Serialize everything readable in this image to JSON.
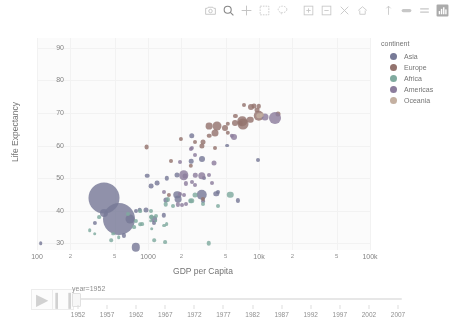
{
  "modebar": {
    "buttons": [
      {
        "name": "camera-icon",
        "title": "Download plot as a png"
      },
      {
        "name": "zoom-icon",
        "title": "Zoom"
      },
      {
        "name": "pan-icon",
        "title": "Pan"
      },
      {
        "name": "zoom-box-select-icon",
        "title": "Box Select"
      },
      {
        "name": "lasso-select-icon",
        "title": "Lasso Select"
      },
      {
        "name": "zoom-in-icon",
        "title": "Zoom in"
      },
      {
        "name": "zoom-out-icon",
        "title": "Zoom out"
      },
      {
        "name": "autoscale-icon",
        "title": "Autoscale"
      },
      {
        "name": "reset-axes-icon",
        "title": "Reset axes"
      },
      {
        "name": "spike-lines-icon",
        "title": "Toggle Spike Lines"
      },
      {
        "name": "hover-compare-icon",
        "title": "Show closest data on hover"
      },
      {
        "name": "hover-closest-icon",
        "title": "Compare data on hover"
      },
      {
        "name": "plotly-logo-icon",
        "title": "Produced with Plotly"
      }
    ]
  },
  "chart_data": {
    "type": "scatter",
    "title": "",
    "xlabel": "GDP per Capita",
    "ylabel": "Life Expectancy",
    "xscale": "log",
    "xlim": [
      100,
      100000
    ],
    "ylim": [
      28,
      93
    ],
    "grid": false,
    "legend_position": "right",
    "legend_title": "continent",
    "size_variable": "population",
    "frame_variable": "year",
    "frame_value": "1952",
    "ytick_labels": [
      "30",
      "40",
      "50",
      "60",
      "70",
      "80",
      "90"
    ],
    "ytick_values": [
      30,
      40,
      50,
      60,
      70,
      80,
      90
    ],
    "xtick_labels": [
      "100",
      "2",
      "5",
      "1000",
      "2",
      "5",
      "10k",
      "2",
      "5",
      "100k"
    ],
    "xtick_values": [
      100,
      200,
      500,
      1000,
      2000,
      5000,
      10000,
      20000,
      50000,
      100000
    ],
    "series": [
      {
        "name": "Asia",
        "color": "#636efa",
        "points": [
          {
            "x": 779,
            "y": 28.8,
            "size": 8.4
          },
          {
            "x": 1828,
            "y": 50.9,
            "size": 5.0
          },
          {
            "x": 684,
            "y": 37.5,
            "size": 9.0
          },
          {
            "x": 400,
            "y": 39.4,
            "size": 8.0
          },
          {
            "x": 3216,
            "y": 50.0,
            "size": 4.0
          },
          {
            "x": 400,
            "y": 44.0,
            "size": 31.0
          },
          {
            "x": 546,
            "y": 37.4,
            "size": 32.0
          },
          {
            "x": 3035,
            "y": 44.9,
            "size": 10.5
          },
          {
            "x": 4130,
            "y": 45.3,
            "size": 5.5
          },
          {
            "x": 1447,
            "y": 43.4,
            "size": 5.2
          },
          {
            "x": 3054,
            "y": 55.9,
            "size": 6.0
          },
          {
            "x": 1875,
            "y": 43.6,
            "size": 6.8
          },
          {
            "x": 2469,
            "y": 63.0,
            "size": 5.5
          },
          {
            "x": 1074,
            "y": 47.5,
            "size": 4.8
          },
          {
            "x": 840,
            "y": 40.4,
            "size": 4.6
          },
          {
            "x": 1469,
            "y": 50.0,
            "size": 4.4
          },
          {
            "x": 331,
            "y": 36.3,
            "size": 4.2
          },
          {
            "x": 1135,
            "y": 37.5,
            "size": 5.8
          },
          {
            "x": 4293,
            "y": 45.9,
            "size": 4.0
          },
          {
            "x": 6459,
            "y": 43.2,
            "size": 4.2
          },
          {
            "x": 1831,
            "y": 45.0,
            "size": 7.5
          },
          {
            "x": 968,
            "y": 40.4,
            "size": 5.0
          },
          {
            "x": 982,
            "y": 50.8,
            "size": 4.6
          },
          {
            "x": 1206,
            "y": 48.5,
            "size": 4.8
          },
          {
            "x": 9867,
            "y": 55.6,
            "size": 4.0
          },
          {
            "x": 108,
            "y": 30.0,
            "size": 3.6
          },
          {
            "x": 1133,
            "y": 36.3,
            "size": 4.0
          },
          {
            "x": 1389,
            "y": 38.6,
            "size": 4.4
          },
          {
            "x": 2441,
            "y": 55.2,
            "size": 4.6
          },
          {
            "x": 605,
            "y": 32.5,
            "size": 4.2
          },
          {
            "x": 3113,
            "y": 42.9,
            "size": 3.8
          },
          {
            "x": 5180,
            "y": 60.0,
            "size": 3.8
          },
          {
            "x": 781,
            "y": 40.0,
            "size": 4.0
          }
        ]
      },
      {
        "name": "Europe",
        "color": "#EF553B",
        "points": [
          {
            "x": 1601,
            "y": 55.2,
            "size": 4.0
          },
          {
            "x": 6137,
            "y": 66.8,
            "size": 6.0
          },
          {
            "x": 8343,
            "y": 68.0,
            "size": 6.5
          },
          {
            "x": 973,
            "y": 59.6,
            "size": 4.8
          },
          {
            "x": 3119,
            "y": 61.2,
            "size": 5.0
          },
          {
            "x": 6876,
            "y": 66.9,
            "size": 4.5
          },
          {
            "x": 9692,
            "y": 70.8,
            "size": 5.0
          },
          {
            "x": 5263,
            "y": 66.6,
            "size": 4.4
          },
          {
            "x": 7029,
            "y": 67.4,
            "size": 9.5
          },
          {
            "x": 7144,
            "y": 66.5,
            "size": 11.0
          },
          {
            "x": 3530,
            "y": 65.9,
            "size": 6.8
          },
          {
            "x": 5263,
            "y": 64.0,
            "size": 4.4
          },
          {
            "x": 7268,
            "y": 72.5,
            "size": 4.0
          },
          {
            "x": 4931,
            "y": 65.5,
            "size": 6.0
          },
          {
            "x": 4215,
            "y": 65.9,
            "size": 9.0
          },
          {
            "x": 9908,
            "y": 72.1,
            "size": 4.4
          },
          {
            "x": 4029,
            "y": 59.2,
            "size": 4.0
          },
          {
            "x": 8942,
            "y": 72.1,
            "size": 5.0
          },
          {
            "x": 4029,
            "y": 64.0,
            "size": 7.0
          },
          {
            "x": 3068,
            "y": 59.8,
            "size": 5.2
          },
          {
            "x": 1969,
            "y": 62.1,
            "size": 4.2
          },
          {
            "x": 2647,
            "y": 61.0,
            "size": 4.0
          },
          {
            "x": 3581,
            "y": 63.0,
            "size": 4.6
          },
          {
            "x": 6137,
            "y": 69.1,
            "size": 4.2
          },
          {
            "x": 8527,
            "y": 71.9,
            "size": 6.0
          },
          {
            "x": 14734,
            "y": 69.6,
            "size": 5.0
          },
          {
            "x": 9979,
            "y": 69.2,
            "size": 10.5
          },
          {
            "x": 3144,
            "y": 43.7,
            "size": 4.0
          },
          {
            "x": 1546,
            "y": 45.0,
            "size": 4.2
          },
          {
            "x": 2428,
            "y": 53.8,
            "size": 4.4
          }
        ]
      },
      {
        "name": "Africa",
        "color": "#00cc96",
        "points": [
          {
            "x": 2449,
            "y": 43.1,
            "size": 5.5
          },
          {
            "x": 3521,
            "y": 30.0,
            "size": 4.5
          },
          {
            "x": 1063,
            "y": 38.2,
            "size": 4.0
          },
          {
            "x": 851,
            "y": 40.0,
            "size": 3.8
          },
          {
            "x": 543,
            "y": 32.0,
            "size": 3.6
          },
          {
            "x": 667,
            "y": 39.0,
            "size": 4.0
          },
          {
            "x": 1172,
            "y": 38.5,
            "size": 4.0
          },
          {
            "x": 1071,
            "y": 40.0,
            "size": 4.0
          },
          {
            "x": 1388,
            "y": 35.5,
            "size": 3.8
          },
          {
            "x": 1178,
            "y": 37.0,
            "size": 3.6
          },
          {
            "x": 1135,
            "y": 31.0,
            "size": 3.6
          },
          {
            "x": 299,
            "y": 34.0,
            "size": 3.6
          },
          {
            "x": 362,
            "y": 38.0,
            "size": 3.8
          },
          {
            "x": 485,
            "y": 33.0,
            "size": 3.6
          },
          {
            "x": 879,
            "y": 36.0,
            "size": 3.8
          },
          {
            "x": 1443,
            "y": 42.0,
            "size": 4.6
          },
          {
            "x": 2463,
            "y": 42.9,
            "size": 4.0
          },
          {
            "x": 1418,
            "y": 30.3,
            "size": 3.8
          },
          {
            "x": 331,
            "y": 33.0,
            "size": 3.6
          },
          {
            "x": 4293,
            "y": 41.4,
            "size": 4.0
          },
          {
            "x": 853,
            "y": 36.0,
            "size": 3.6
          },
          {
            "x": 1688,
            "y": 41.5,
            "size": 4.0
          },
          {
            "x": 779,
            "y": 37.0,
            "size": 4.2
          },
          {
            "x": 1077,
            "y": 38.0,
            "size": 4.8
          },
          {
            "x": 2672,
            "y": 45.0,
            "size": 5.0
          },
          {
            "x": 1077,
            "y": 34.5,
            "size": 3.6
          },
          {
            "x": 468,
            "y": 31.0,
            "size": 3.6
          },
          {
            "x": 752,
            "y": 35.0,
            "size": 3.8
          },
          {
            "x": 1062,
            "y": 37.0,
            "size": 3.6
          },
          {
            "x": 3112,
            "y": 42.0,
            "size": 4.0
          },
          {
            "x": 5486,
            "y": 45.0,
            "size": 6.5
          },
          {
            "x": 1515,
            "y": 43.5,
            "size": 4.2
          },
          {
            "x": 1468,
            "y": 36.0,
            "size": 3.8
          }
        ]
      },
      {
        "name": "Americas",
        "color": "#ab63fa",
        "points": [
          {
            "x": 5911,
            "y": 62.5,
            "size": 6.0
          },
          {
            "x": 2677,
            "y": 50.9,
            "size": 4.4
          },
          {
            "x": 2109,
            "y": 50.9,
            "size": 9.5
          },
          {
            "x": 3939,
            "y": 54.7,
            "size": 5.0
          },
          {
            "x": 2144,
            "y": 50.6,
            "size": 5.0
          },
          {
            "x": 2627,
            "y": 57.2,
            "size": 4.0
          },
          {
            "x": 1397,
            "y": 45.9,
            "size": 4.0
          },
          {
            "x": 2480,
            "y": 59.4,
            "size": 4.2
          },
          {
            "x": 3522,
            "y": 51.0,
            "size": 4.0
          },
          {
            "x": 2194,
            "y": 48.4,
            "size": 4.2
          },
          {
            "x": 2627,
            "y": 48.0,
            "size": 4.0
          },
          {
            "x": 1873,
            "y": 42.0,
            "size": 4.2
          },
          {
            "x": 2194,
            "y": 42.0,
            "size": 4.0
          },
          {
            "x": 2023,
            "y": 41.9,
            "size": 4.0
          },
          {
            "x": 1952,
            "y": 45.3,
            "size": 4.0
          },
          {
            "x": 3048,
            "y": 50.8,
            "size": 7.5
          },
          {
            "x": 2480,
            "y": 49.0,
            "size": 4.0
          },
          {
            "x": 1952,
            "y": 55.1,
            "size": 4.0
          },
          {
            "x": 2428,
            "y": 59.1,
            "size": 4.2
          },
          {
            "x": 13990,
            "y": 68.4,
            "size": 12.0
          },
          {
            "x": 11367,
            "y": 68.8,
            "size": 7.0
          },
          {
            "x": 5716,
            "y": 63.0,
            "size": 4.4
          },
          {
            "x": 3758,
            "y": 48.4,
            "size": 4.0
          },
          {
            "x": 2125,
            "y": 45.0,
            "size": 4.0
          }
        ]
      },
      {
        "name": "Oceania",
        "color": "#FFA15A",
        "points": [
          {
            "x": 10040,
            "y": 69.1,
            "size": 5.5
          },
          {
            "x": 10557,
            "y": 69.4,
            "size": 4.2
          }
        ]
      }
    ]
  },
  "animation": {
    "play_label": "▶",
    "pause_label": "❙❙",
    "slider_prefix": "year=1952",
    "current_frame": "1952",
    "frames": [
      "1952",
      "1957",
      "1962",
      "1967",
      "1972",
      "1977",
      "1982",
      "1987",
      "1992",
      "1997",
      "2002",
      "2007"
    ]
  },
  "colors": {
    "background": "#ffffff",
    "plot_background": "#fbfbfb",
    "axis_text": "#7e7e7e",
    "title_text": "#6e6e6e",
    "grid": "#f2f2f2"
  }
}
